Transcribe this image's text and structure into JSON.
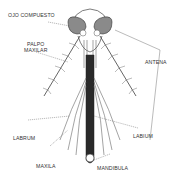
{
  "figure": {
    "colors": {
      "ink": "#333333",
      "eye_fill": "#8a8a8a",
      "proboscis": "#2a2a2a",
      "background": "#ffffff"
    },
    "labels": {
      "ojo_compuesto": "OJO COMPUESTO",
      "palpo_maxilar_line1": "PALPO",
      "palpo_maxilar_line2": "MAXILAR",
      "antena": "ANTENA",
      "labrum": "LABRUM",
      "labium": "LABIUM",
      "maxila": "MAXILA",
      "mandibula": "MANDIBULA"
    }
  }
}
